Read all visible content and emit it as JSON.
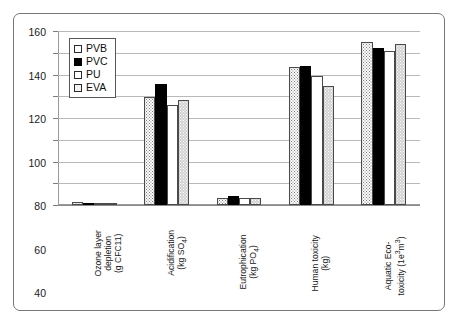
{
  "chart_data": {
    "type": "bar",
    "title": "",
    "subtitle": "",
    "xlabel": "",
    "ylabel": "",
    "ylim": [
      0,
      160
    ],
    "ytick_step": 20,
    "yticks": [
      0,
      20,
      40,
      60,
      80,
      100,
      120,
      140,
      160
    ],
    "ytick_labels": [
      "0",
      "20",
      "40",
      "60",
      "80",
      "100",
      "120",
      "140",
      "160"
    ],
    "grid": true,
    "grid_axis": "y",
    "legend_position": "upper-left-inside",
    "categories": [
      "Ozone layer depletion (g CFC11)",
      "Acidification (kg SO4)",
      "Eutrophication (kg PO4)",
      "Human toxicity (kg)",
      "Aquatic Eco-toxicity (1e3 m3)"
    ],
    "category_lines": [
      [
        "Ozone layer",
        "depletion",
        "(g CFC11)"
      ],
      [
        "Acidification",
        "(kg SO",
        "4",
        ")"
      ],
      [
        "Eutrophication",
        "(kg PO",
        "4",
        ")"
      ],
      [
        "Human toxicity",
        "(kg)"
      ],
      [
        "Aquatic Eco-",
        "toxicity (1e",
        "3",
        "m",
        "3",
        ")"
      ]
    ],
    "series": [
      {
        "name": "PVB",
        "fill": "stipple-white",
        "color": "#fbfbfb",
        "values": [
          3,
          99,
          6,
          127,
          150
        ]
      },
      {
        "name": "PVC",
        "fill": "solid-black",
        "color": "#000000",
        "values": [
          2,
          111,
          8,
          128,
          144
        ]
      },
      {
        "name": "PU",
        "fill": "plain-white",
        "color": "#ffffff",
        "values": [
          2,
          92,
          6,
          119,
          142
        ]
      },
      {
        "name": "EVA",
        "fill": "stipple-grey",
        "color": "#d2d2d2",
        "values": [
          2,
          97,
          6,
          109,
          148
        ]
      }
    ]
  },
  "legend": {
    "items": [
      {
        "label": "PVB"
      },
      {
        "label": "PVC"
      },
      {
        "label": "PU"
      },
      {
        "label": "EVA"
      }
    ]
  },
  "axis": {
    "y_labels": [
      "160",
      "140",
      "120",
      "100",
      "80",
      "60",
      "40",
      "20",
      "0"
    ]
  },
  "colors": {
    "frame": "#767676",
    "grid": "#b9b9b9",
    "axis": "#9a9a9a",
    "bar_edge": "#4a4a4a",
    "pvc_black": "#000000",
    "eva_grey": "#d2d2d2"
  }
}
